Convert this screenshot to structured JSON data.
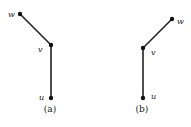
{
  "figures": [
    {
      "caption": "(a)",
      "nodes": [
        {
          "id": "w",
          "label": "w",
          "x": 20,
          "y": 14,
          "lx": 8,
          "ly": 17
        },
        {
          "id": "v",
          "label": "v",
          "x": 51,
          "y": 45,
          "lx": 38,
          "ly": 52
        },
        {
          "id": "u",
          "label": "u",
          "x": 51,
          "y": 98,
          "lx": 39,
          "ly": 100
        }
      ],
      "edges": [
        [
          "w",
          "v"
        ],
        [
          "v",
          "u"
        ]
      ],
      "caption_x": 50,
      "caption_y": 112
    },
    {
      "caption": "(b)",
      "nodes": [
        {
          "id": "w",
          "label": "w",
          "x": 172,
          "y": 19,
          "lx": 177,
          "ly": 24
        },
        {
          "id": "v",
          "label": "v",
          "x": 143,
          "y": 48,
          "lx": 151,
          "ly": 55
        },
        {
          "id": "u",
          "label": "u",
          "x": 143,
          "y": 98,
          "lx": 151,
          "ly": 99
        }
      ],
      "edges": [
        [
          "w",
          "v"
        ],
        [
          "v",
          "u"
        ]
      ],
      "caption_x": 142,
      "caption_y": 112
    }
  ]
}
